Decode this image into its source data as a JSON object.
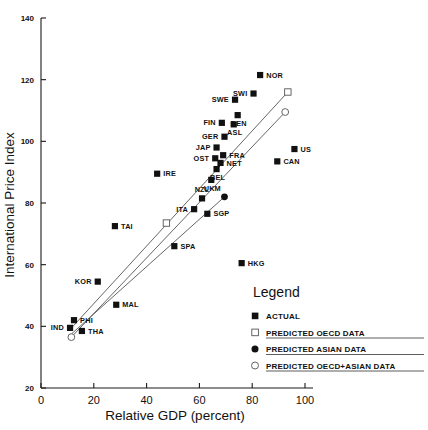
{
  "chart_data": {
    "type": "scatter",
    "title": "",
    "xlabel": "Relative GDP (percent)",
    "ylabel": "International Price Index",
    "xlim": [
      0,
      100
    ],
    "ylim": [
      20,
      140
    ],
    "xticks": [
      0,
      20,
      40,
      60,
      80,
      100
    ],
    "yticks": [
      20,
      40,
      60,
      80,
      100,
      120,
      140
    ],
    "grid": false,
    "legend_position": "inside-lower-right",
    "points": [
      {
        "label": "NOR",
        "x": 83.0,
        "y": 121.5,
        "series": "ACTUAL",
        "label_side": "right"
      },
      {
        "label": "SWI",
        "x": 80.5,
        "y": 115.5,
        "series": "ACTUAL",
        "label_side": "left"
      },
      {
        "label": "SWE",
        "x": 73.5,
        "y": 113.5,
        "series": "ACTUAL",
        "label_side": "left"
      },
      {
        "label": "DEN",
        "x": 74.5,
        "y": 108.5,
        "series": "ACTUAL",
        "label_side": "below"
      },
      {
        "label": "ASL",
        "x": 73.0,
        "y": 105.5,
        "series": "ACTUAL",
        "label_side": "below"
      },
      {
        "label": "FIN",
        "x": 68.5,
        "y": 106.0,
        "series": "ACTUAL",
        "label_side": "left"
      },
      {
        "label": "GER",
        "x": 69.5,
        "y": 101.5,
        "series": "ACTUAL",
        "label_side": "left"
      },
      {
        "label": "JAP",
        "x": 66.5,
        "y": 98.0,
        "series": "ACTUAL",
        "label_side": "left"
      },
      {
        "label": "OST",
        "x": 66.0,
        "y": 94.5,
        "series": "ACTUAL",
        "label_side": "left"
      },
      {
        "label": "FRA",
        "x": 69.0,
        "y": 95.5,
        "series": "ACTUAL",
        "label_side": "right"
      },
      {
        "label": "NET",
        "x": 68.0,
        "y": 93.0,
        "series": "ACTUAL",
        "label_side": "right"
      },
      {
        "label": "BEL",
        "x": 66.5,
        "y": 91.0,
        "series": "ACTUAL",
        "label_side": "below"
      },
      {
        "label": "UKM",
        "x": 64.5,
        "y": 87.5,
        "series": "ACTUAL",
        "label_side": "below"
      },
      {
        "label": "US",
        "x": 96.0,
        "y": 97.5,
        "series": "ACTUAL",
        "label_side": "right"
      },
      {
        "label": "CAN",
        "x": 89.5,
        "y": 93.5,
        "series": "ACTUAL",
        "label_side": "right"
      },
      {
        "label": "IRE",
        "x": 44.0,
        "y": 89.5,
        "series": "ACTUAL",
        "label_side": "right"
      },
      {
        "label": "NZL",
        "x": 61.0,
        "y": 81.5,
        "series": "ACTUAL",
        "label_side": "above"
      },
      {
        "label": "ITA",
        "x": 58.0,
        "y": 78.0,
        "series": "ACTUAL",
        "label_side": "left"
      },
      {
        "label": "SGP",
        "x": 63.0,
        "y": 76.5,
        "series": "ACTUAL",
        "label_side": "right"
      },
      {
        "label": "TAI",
        "x": 28.0,
        "y": 72.5,
        "series": "ACTUAL",
        "label_side": "right"
      },
      {
        "label": "SPA",
        "x": 50.5,
        "y": 66.0,
        "series": "ACTUAL",
        "label_side": "right"
      },
      {
        "label": "HKG",
        "x": 76.0,
        "y": 60.5,
        "series": "ACTUAL",
        "label_side": "right"
      },
      {
        "label": "KOR",
        "x": 21.5,
        "y": 54.5,
        "series": "ACTUAL",
        "label_side": "left"
      },
      {
        "label": "MAL",
        "x": 28.5,
        "y": 47.0,
        "series": "ACTUAL",
        "label_side": "right"
      },
      {
        "label": "PHI",
        "x": 12.5,
        "y": 42.0,
        "series": "ACTUAL",
        "label_side": "right"
      },
      {
        "label": "IND",
        "x": 11.0,
        "y": 39.5,
        "series": "ACTUAL",
        "label_side": "left"
      },
      {
        "label": "THA",
        "x": 15.5,
        "y": 38.5,
        "series": "ACTUAL",
        "label_side": "right"
      }
    ],
    "predicted_points": [
      {
        "series": "PREDICTED OECD DATA",
        "x": 93.5,
        "y": 116.0
      },
      {
        "series": "PREDICTED OECD DATA",
        "x": 47.5,
        "y": 73.5
      },
      {
        "series": "PREDICTED ASIAN DATA",
        "x": 69.5,
        "y": 82.0
      },
      {
        "series": "PREDICTED OECD+ASIAN DATA",
        "x": 92.5,
        "y": 109.5
      },
      {
        "series": "PREDICTED OECD+ASIAN DATA",
        "x": 11.5,
        "y": 36.5
      }
    ],
    "fit_lines": [
      {
        "name": "OECD fit",
        "x1": 10.5,
        "y1": 38.5,
        "x2": 93.5,
        "y2": 116.0
      },
      {
        "name": "OECD+ASIAN fit",
        "x1": 11.5,
        "y1": 36.5,
        "x2": 92.5,
        "y2": 109.5
      },
      {
        "name": "ASIAN fit",
        "x1": 11.5,
        "y1": 37.5,
        "x2": 69.5,
        "y2": 82.0
      }
    ]
  },
  "axes": {
    "x_title": "Relative GDP (percent)",
    "y_title": "International Price Index",
    "x_ticks": [
      "0",
      "20",
      "40",
      "60",
      "80",
      "100"
    ],
    "y_ticks": [
      "20",
      "40",
      "60",
      "80",
      "100",
      "120",
      "140"
    ]
  },
  "legend": {
    "title": "Legend",
    "entries": [
      {
        "marker": "filled-square",
        "label": "ACTUAL"
      },
      {
        "marker": "open-square",
        "label": "PREDICTED OECD DATA"
      },
      {
        "marker": "filled-circle",
        "label": "PREDICTED ASIAN DATA"
      },
      {
        "marker": "open-circle",
        "label": "PREDICTED OECD+ASIAN DATA"
      }
    ]
  },
  "colors": {
    "marker": "#111111",
    "line": "#555555",
    "axis": "#1a1a1a",
    "background": "#ffffff"
  }
}
